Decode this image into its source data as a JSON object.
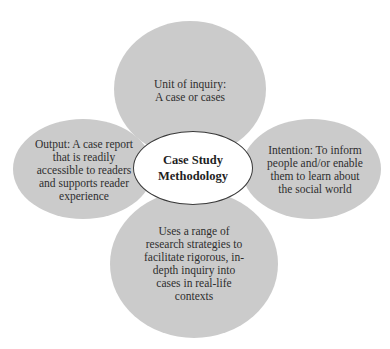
{
  "diagram": {
    "type": "petal-diagram",
    "center": {
      "title": "Case Study\nMethodology"
    },
    "petals": [
      {
        "position": "top",
        "text": "Unit of inquiry:\nA case or cases"
      },
      {
        "position": "right",
        "text": "Intention: To inform\npeople and/or enable\nthem to learn about\nthe social world"
      },
      {
        "position": "bottom",
        "text": "Uses a range of\nresearch strategies to\nfacilitate rigorous, in-\ndepth inquiry into\ncases in real-life\ncontexts"
      },
      {
        "position": "left",
        "text": "Output: A case report\nthat is readily\naccessible to readers\nand supports reader\nexperience"
      }
    ],
    "colors": {
      "petal_fill": "#cbcbcb",
      "center_fill": "#ffffff",
      "center_border": "#3a3a3a",
      "text": "#2e2e2e"
    }
  }
}
